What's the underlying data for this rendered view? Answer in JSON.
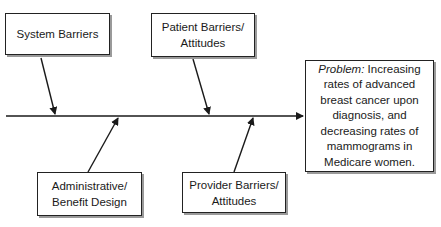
{
  "diagram": {
    "type": "fishbone",
    "causes": {
      "system": "System Barriers",
      "patient": "Patient Barriers/\nAttitudes",
      "admin": "Administrative/\nBenefit Design",
      "provider": "Provider Barriers/\nAttitudes"
    },
    "problem": {
      "label": "Problem:",
      "text": " Increasing rates of advanced breast cancer upon diagnosis, and decreasing rates of mammograms in Medicare women."
    }
  }
}
